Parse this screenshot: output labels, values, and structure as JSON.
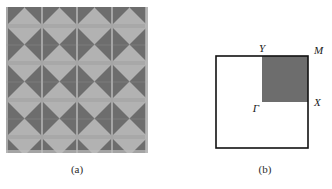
{
  "figure": {
    "panel_a": {
      "caption": "(a)",
      "description": "square-lattice photonic crystal pattern of triangular pixels",
      "grid_cols": 4,
      "grid_rows": 4,
      "cell_size_px": 35,
      "colors": {
        "light": "#b0b0b0",
        "dark": "#6e6e6e",
        "separator": "#8a8a8a",
        "background": "#b0b0b0"
      },
      "cell_pattern": "each unit cell is a square split by both diagonals into four triangles; left and right triangles are dark, top and bottom triangles are light, forming a bowtie motif"
    },
    "panel_b": {
      "caption": "(b)",
      "description": "first Brillouin zone of the square lattice with irreducible wedge shaded",
      "symmetry_points": [
        {
          "name": "gamma",
          "label": "Γ",
          "position": "center"
        },
        {
          "name": "Y",
          "label": "Y",
          "position": "top-center"
        },
        {
          "name": "M",
          "label": "M",
          "position": "top-right"
        },
        {
          "name": "X",
          "label": "X",
          "position": "right-center"
        }
      ],
      "shaded_region": "upper-right quadrant",
      "colors": {
        "outline": "#111111",
        "shaded_fill": "#6e6e6e",
        "zone_fill": "#ffffff"
      }
    }
  }
}
